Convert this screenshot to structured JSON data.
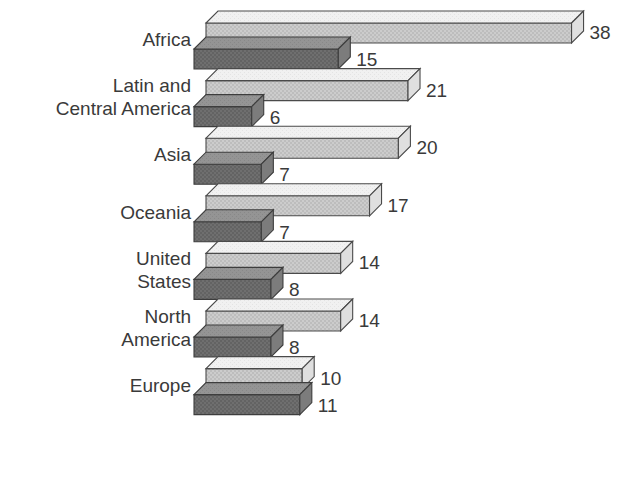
{
  "chart_data": {
    "type": "bar",
    "orientation": "horizontal",
    "style": "3d-isometric-bar",
    "title": "",
    "subtitle": "",
    "xlabel": "",
    "ylabel": "",
    "grid": false,
    "legend": "none",
    "axis_visible": false,
    "xlim": [
      0,
      38
    ],
    "categories": [
      "Africa",
      "Latin and Central America",
      "Asia",
      "Oceania",
      "United States",
      "North America",
      "Europe"
    ],
    "category_label_lines": [
      [
        "Africa"
      ],
      [
        "Latin and",
        "Central America"
      ],
      [
        "Asia"
      ],
      [
        "Oceania"
      ],
      [
        "United",
        "States"
      ],
      [
        "North",
        "America"
      ],
      [
        "Europe"
      ]
    ],
    "series": [
      {
        "name": "series-1-light",
        "color": "#ededed",
        "values": [
          38,
          21,
          20,
          17,
          14,
          14,
          10
        ]
      },
      {
        "name": "series-2-dark",
        "color": "#8f8f8f",
        "values": [
          15,
          6,
          7,
          7,
          8,
          8,
          11
        ]
      }
    ],
    "value_labels": {
      "series_1": [
        "38",
        "21",
        "20",
        "17",
        "14",
        "14",
        "10"
      ],
      "series_2": [
        "15",
        "6",
        "7",
        "7",
        "8",
        "8",
        "11"
      ]
    },
    "colors": {
      "light_top": "#f0f0f0",
      "light_front": "#c9c9c9",
      "light_cap": "#dcdcdc",
      "dark_top": "#8f8f8f",
      "dark_front": "#6a6a6a",
      "dark_cap": "#7b7b7b",
      "outline": "#4a4a4a",
      "text": "#3a3a3a",
      "background": "#ffffff"
    }
  }
}
